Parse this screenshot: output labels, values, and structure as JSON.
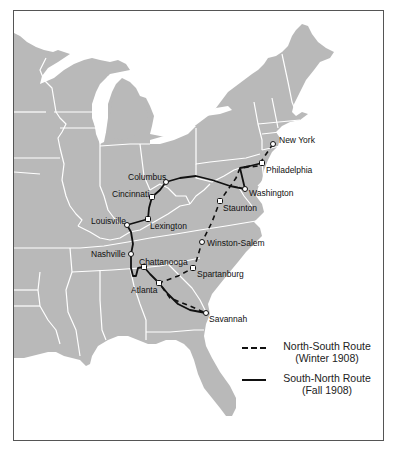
{
  "map": {
    "land_color": "#b9b9b9",
    "border_color": "#ffffff",
    "route_color": "#111111",
    "cities": [
      {
        "name": "New York",
        "x": 273,
        "y": 144,
        "lx": 279,
        "ly": 143
      },
      {
        "name": "Philadelphia",
        "x": 262,
        "y": 163,
        "lx": 266,
        "ly": 173
      },
      {
        "name": "Washington",
        "x": 245,
        "y": 189,
        "lx": 249,
        "ly": 196
      },
      {
        "name": "Staunton",
        "x": 220,
        "y": 201,
        "lx": 223,
        "ly": 211
      },
      {
        "name": "Winston-Salem",
        "x": 202,
        "y": 242,
        "lx": 207,
        "ly": 246
      },
      {
        "name": "Spartanburg",
        "x": 193,
        "y": 268,
        "lx": 197,
        "ly": 277
      },
      {
        "name": "Savannah",
        "x": 206,
        "y": 313,
        "lx": 209,
        "ly": 322
      },
      {
        "name": "Atlanta",
        "x": 159,
        "y": 283,
        "lx": 131,
        "ly": 293
      },
      {
        "name": "Chattanooga",
        "x": 144,
        "y": 267,
        "lx": 139,
        "ly": 265
      },
      {
        "name": "Nashville",
        "x": 131,
        "y": 254,
        "lx": 91,
        "ly": 257
      },
      {
        "name": "Louisville",
        "x": 127,
        "y": 225,
        "lx": 91,
        "ly": 224
      },
      {
        "name": "Lexington",
        "x": 148,
        "y": 219,
        "lx": 150,
        "ly": 229
      },
      {
        "name": "Cincinnati",
        "x": 152,
        "y": 197,
        "lx": 112,
        "ly": 197
      },
      {
        "name": "Columbus",
        "x": 166,
        "y": 182,
        "lx": 128,
        "ly": 180
      }
    ]
  },
  "legend": {
    "north_south": {
      "line1": "North-South Route",
      "line2": "(Winter 1908)",
      "style": "dashed"
    },
    "south_north": {
      "line1": "South-North Route",
      "line2": "(Fall 1908)",
      "style": "solid"
    }
  }
}
